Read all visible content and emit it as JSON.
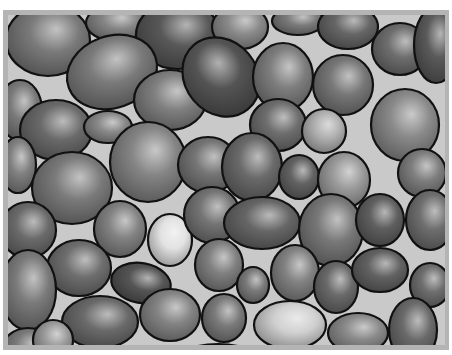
{
  "image": {
    "subject": "Illustration of rounded gray pebbles with black outlines packed together",
    "frame_color": "#b4b4b4",
    "gap_color": "#c9c9c9",
    "outline_color": "#111111"
  },
  "stones": [
    {
      "cx": 40,
      "cy": 25,
      "rx": 42,
      "ry": 36,
      "rot": 0,
      "shade": "#7a7a7a"
    },
    {
      "cx": 108,
      "cy": 8,
      "rx": 30,
      "ry": 18,
      "rot": 0,
      "shade": "#858585"
    },
    {
      "cx": 170,
      "cy": 20,
      "rx": 42,
      "ry": 34,
      "rot": 0,
      "shade": "#585858"
    },
    {
      "cx": 232,
      "cy": 12,
      "rx": 28,
      "ry": 22,
      "rot": 0,
      "shade": "#8a8a8a"
    },
    {
      "cx": 290,
      "cy": 6,
      "rx": 26,
      "ry": 14,
      "rot": 0,
      "shade": "#7a7a7a"
    },
    {
      "cx": 340,
      "cy": 12,
      "rx": 30,
      "ry": 22,
      "rot": 0,
      "shade": "#666666"
    },
    {
      "cx": 392,
      "cy": 34,
      "rx": 28,
      "ry": 26,
      "rot": 0,
      "shade": "#6e6e6e"
    },
    {
      "cx": 428,
      "cy": 30,
      "rx": 22,
      "ry": 38,
      "rot": 0,
      "shade": "#5a5a5a"
    },
    {
      "cx": 104,
      "cy": 57,
      "rx": 46,
      "ry": 36,
      "rot": -20,
      "shade": "#7a7a7a"
    },
    {
      "cx": 162,
      "cy": 85,
      "rx": 36,
      "ry": 30,
      "rot": 0,
      "shade": "#808080"
    },
    {
      "cx": 213,
      "cy": 62,
      "rx": 36,
      "ry": 42,
      "rot": -40,
      "shade": "#545454"
    },
    {
      "cx": 275,
      "cy": 62,
      "rx": 30,
      "ry": 34,
      "rot": 0,
      "shade": "#7e7e7e"
    },
    {
      "cx": 335,
      "cy": 70,
      "rx": 30,
      "ry": 30,
      "rot": 0,
      "shade": "#777777"
    },
    {
      "cx": 12,
      "cy": 95,
      "rx": 22,
      "ry": 30,
      "rot": 0,
      "shade": "#7a7a7a"
    },
    {
      "cx": 48,
      "cy": 115,
      "rx": 36,
      "ry": 30,
      "rot": 0,
      "shade": "#6a6a6a"
    },
    {
      "cx": 100,
      "cy": 112,
      "rx": 24,
      "ry": 16,
      "rot": 0,
      "shade": "#888888"
    },
    {
      "cx": 270,
      "cy": 110,
      "rx": 28,
      "ry": 26,
      "rot": 0,
      "shade": "#6e6e6e"
    },
    {
      "cx": 316,
      "cy": 116,
      "rx": 22,
      "ry": 22,
      "rot": 0,
      "shade": "#b0b0b0"
    },
    {
      "cx": 397,
      "cy": 110,
      "rx": 34,
      "ry": 36,
      "rot": 0,
      "shade": "#8a8a8a"
    },
    {
      "cx": 10,
      "cy": 150,
      "rx": 18,
      "ry": 28,
      "rot": 0,
      "shade": "#808080"
    },
    {
      "cx": 64,
      "cy": 173,
      "rx": 40,
      "ry": 36,
      "rot": 0,
      "shade": "#7a7a7a"
    },
    {
      "cx": 140,
      "cy": 147,
      "rx": 38,
      "ry": 40,
      "rot": 0,
      "shade": "#858585"
    },
    {
      "cx": 200,
      "cy": 150,
      "rx": 30,
      "ry": 28,
      "rot": 0,
      "shade": "#757575"
    },
    {
      "cx": 244,
      "cy": 152,
      "rx": 30,
      "ry": 34,
      "rot": 0,
      "shade": "#6a6a6a"
    },
    {
      "cx": 291,
      "cy": 162,
      "rx": 20,
      "ry": 22,
      "rot": 0,
      "shade": "#626262"
    },
    {
      "cx": 336,
      "cy": 165,
      "rx": 26,
      "ry": 28,
      "rot": 0,
      "shade": "#9a9a9a"
    },
    {
      "cx": 414,
      "cy": 158,
      "rx": 24,
      "ry": 24,
      "rot": 0,
      "shade": "#7e7e7e"
    },
    {
      "cx": 422,
      "cy": 205,
      "rx": 24,
      "ry": 30,
      "rot": 0,
      "shade": "#6e6e6e"
    },
    {
      "cx": 20,
      "cy": 215,
      "rx": 28,
      "ry": 28,
      "rot": 0,
      "shade": "#6a6a6a"
    },
    {
      "cx": 112,
      "cy": 214,
      "rx": 26,
      "ry": 28,
      "rot": 0,
      "shade": "#828282"
    },
    {
      "cx": 162,
      "cy": 225,
      "rx": 22,
      "ry": 26,
      "rot": 0,
      "shade": "#e2e2e2"
    },
    {
      "cx": 204,
      "cy": 200,
      "rx": 28,
      "ry": 28,
      "rot": 0,
      "shade": "#747474"
    },
    {
      "cx": 254,
      "cy": 208,
      "rx": 38,
      "ry": 26,
      "rot": 0,
      "shade": "#666666"
    },
    {
      "cx": 323,
      "cy": 215,
      "rx": 32,
      "ry": 36,
      "rot": 0,
      "shade": "#787878"
    },
    {
      "cx": 372,
      "cy": 205,
      "rx": 24,
      "ry": 26,
      "rot": 0,
      "shade": "#5f5f5f"
    },
    {
      "cx": 71,
      "cy": 253,
      "rx": 32,
      "ry": 28,
      "rot": 0,
      "shade": "#6e6e6e"
    },
    {
      "cx": 20,
      "cy": 275,
      "rx": 28,
      "ry": 40,
      "rot": 0,
      "shade": "#7a7a7a"
    },
    {
      "cx": 133,
      "cy": 268,
      "rx": 30,
      "ry": 20,
      "rot": 10,
      "shade": "#555555"
    },
    {
      "cx": 211,
      "cy": 250,
      "rx": 24,
      "ry": 26,
      "rot": 0,
      "shade": "#808080"
    },
    {
      "cx": 245,
      "cy": 270,
      "rx": 16,
      "ry": 18,
      "rot": 0,
      "shade": "#7a7a7a"
    },
    {
      "cx": 287,
      "cy": 258,
      "rx": 24,
      "ry": 28,
      "rot": 0,
      "shade": "#828282"
    },
    {
      "cx": 328,
      "cy": 272,
      "rx": 22,
      "ry": 26,
      "rot": 0,
      "shade": "#6a6a6a"
    },
    {
      "cx": 372,
      "cy": 255,
      "rx": 28,
      "ry": 22,
      "rot": 0,
      "shade": "#626262"
    },
    {
      "cx": 422,
      "cy": 270,
      "rx": 20,
      "ry": 22,
      "rot": 0,
      "shade": "#6e6e6e"
    },
    {
      "cx": 92,
      "cy": 307,
      "rx": 38,
      "ry": 26,
      "rot": 0,
      "shade": "#6a6a6a"
    },
    {
      "cx": 162,
      "cy": 300,
      "rx": 30,
      "ry": 26,
      "rot": 0,
      "shade": "#848484"
    },
    {
      "cx": 216,
      "cy": 303,
      "rx": 22,
      "ry": 24,
      "rot": 0,
      "shade": "#7a7a7a"
    },
    {
      "cx": 282,
      "cy": 310,
      "rx": 36,
      "ry": 24,
      "rot": 0,
      "shade": "#d0d0d0"
    },
    {
      "cx": 350,
      "cy": 318,
      "rx": 30,
      "ry": 20,
      "rot": 0,
      "shade": "#8a8a8a"
    },
    {
      "cx": 405,
      "cy": 315,
      "rx": 24,
      "ry": 32,
      "rot": 0,
      "shade": "#6a6a6a"
    },
    {
      "cx": 20,
      "cy": 335,
      "rx": 26,
      "ry": 22,
      "rot": 0,
      "shade": "#7a7a7a"
    },
    {
      "cx": 45,
      "cy": 325,
      "rx": 20,
      "ry": 20,
      "rot": 0,
      "shade": "#9a9a9a"
    },
    {
      "cx": 210,
      "cy": 345,
      "rx": 40,
      "ry": 16,
      "rot": 0,
      "shade": "#707070"
    },
    {
      "cx": 140,
      "cy": 345,
      "rx": 24,
      "ry": 12,
      "rot": 0,
      "shade": "#7a7a7a"
    },
    {
      "cx": 330,
      "cy": 350,
      "rx": 30,
      "ry": 12,
      "rot": 0,
      "shade": "#858585"
    }
  ]
}
